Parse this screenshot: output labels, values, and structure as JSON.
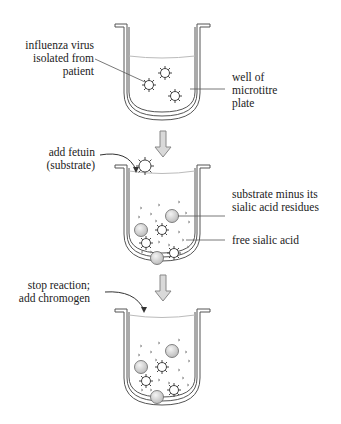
{
  "diagram": {
    "steps": [
      {
        "step": 1,
        "labels": {
          "virus": "influenza virus\nisolated from\npatient",
          "well": "well of\nmicrotitre\nplate"
        }
      },
      {
        "step": 2,
        "action": "add fetuin\n(substrate)",
        "labels": {
          "substrate": "substrate minus its\nsialic acid residues",
          "sialic": "free sialic acid"
        }
      },
      {
        "step": 3,
        "action": "stop reaction;\nadd chromogen"
      }
    ],
    "colors": {
      "outline": "#555555",
      "arrow_fill": "#d9d9d9",
      "arrow_stroke": "#888888",
      "liquid": "#bbbbbb",
      "ball_fill": "#d8d8d8",
      "text": "#222222"
    }
  }
}
